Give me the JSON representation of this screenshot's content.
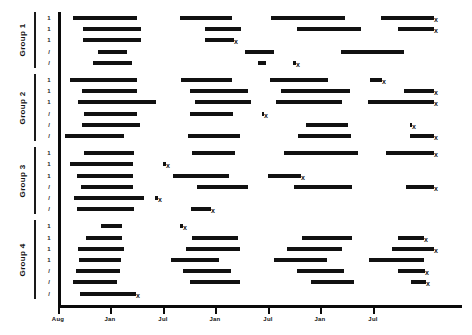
{
  "chart_data": {
    "type": "bar",
    "chart_style": "horizontal-interval-timeline",
    "title": "",
    "xlabel": "",
    "ylabel": "",
    "x_axis": {
      "tick_labels": [
        "Aug",
        "Jan",
        "Jul",
        "Jan",
        "Jul",
        "Jan",
        "Jul"
      ],
      "tick_pixels": [
        58,
        110,
        163,
        215,
        268,
        320,
        373
      ],
      "grid": false
    },
    "y_axis": {
      "group_labels": [
        "Group 1",
        "Group 2",
        "Group 3",
        "Group 4"
      ],
      "row_tick_labels": [
        "1",
        "1",
        "1",
        "/",
        "/",
        "1",
        "1",
        "1",
        "/",
        "/",
        "/",
        "1",
        "1",
        "1",
        "/",
        "/",
        "/",
        "1",
        "1",
        "1",
        "1",
        "/",
        "/",
        "/"
      ]
    },
    "legend": {
      "entries": [],
      "position": "none"
    },
    "annotations": {
      "censor_marker": "x"
    },
    "groups": [
      {
        "name": "Group 1",
        "rows": [
          {
            "tick": "1",
            "segments": [
              {
                "x0": 73,
                "x1": 137,
                "censored": false
              },
              {
                "x0": 180,
                "x1": 232,
                "censored": false
              },
              {
                "x0": 271,
                "x1": 345,
                "censored": false
              },
              {
                "x0": 381,
                "x1": 434,
                "censored": true
              }
            ]
          },
          {
            "tick": "1",
            "segments": [
              {
                "x0": 83,
                "x1": 141,
                "censored": false
              },
              {
                "x0": 205,
                "x1": 241,
                "censored": false
              },
              {
                "x0": 297,
                "x1": 361,
                "censored": false
              },
              {
                "x0": 398,
                "x1": 434,
                "censored": true
              }
            ]
          },
          {
            "tick": "1",
            "segments": [
              {
                "x0": 83,
                "x1": 141,
                "censored": false
              },
              {
                "x0": 205,
                "x1": 234,
                "censored": true
              }
            ]
          },
          {
            "tick": "/",
            "segments": [
              {
                "x0": 98,
                "x1": 127,
                "censored": false
              },
              {
                "x0": 245,
                "x1": 274,
                "censored": false
              },
              {
                "x0": 341,
                "x1": 404,
                "censored": false
              }
            ]
          },
          {
            "tick": "/",
            "segments": [
              {
                "x0": 93,
                "x1": 132,
                "censored": false
              },
              {
                "x0": 258,
                "x1": 266,
                "censored": false
              },
              {
                "x0": 293,
                "x1": 296,
                "censored": true
              }
            ]
          }
        ]
      },
      {
        "name": "Group 2",
        "rows": [
          {
            "tick": "1",
            "segments": [
              {
                "x0": 70,
                "x1": 137,
                "censored": false
              },
              {
                "x0": 181,
                "x1": 232,
                "censored": false
              },
              {
                "x0": 270,
                "x1": 328,
                "censored": false
              },
              {
                "x0": 370,
                "x1": 382,
                "censored": true
              }
            ]
          },
          {
            "tick": "1",
            "segments": [
              {
                "x0": 82,
                "x1": 137,
                "censored": false
              },
              {
                "x0": 190,
                "x1": 248,
                "censored": false
              },
              {
                "x0": 281,
                "x1": 350,
                "censored": false
              },
              {
                "x0": 404,
                "x1": 434,
                "censored": true
              }
            ]
          },
          {
            "tick": "1",
            "segments": [
              {
                "x0": 78,
                "x1": 156,
                "censored": false
              },
              {
                "x0": 195,
                "x1": 251,
                "censored": false
              },
              {
                "x0": 276,
                "x1": 342,
                "censored": false
              },
              {
                "x0": 368,
                "x1": 434,
                "censored": true
              }
            ]
          },
          {
            "tick": "/",
            "segments": [
              {
                "x0": 84,
                "x1": 137,
                "censored": false
              },
              {
                "x0": 190,
                "x1": 233,
                "censored": false
              },
              {
                "x0": 262,
                "x1": 264,
                "censored": true
              }
            ]
          },
          {
            "tick": "/",
            "segments": [
              {
                "x0": 82,
                "x1": 140,
                "censored": false
              },
              {
                "x0": 306,
                "x1": 348,
                "censored": false
              },
              {
                "x0": 410,
                "x1": 412,
                "censored": true
              }
            ]
          },
          {
            "tick": "/",
            "segments": [
              {
                "x0": 65,
                "x1": 124,
                "censored": false
              },
              {
                "x0": 188,
                "x1": 240,
                "censored": false
              },
              {
                "x0": 298,
                "x1": 351,
                "censored": false
              },
              {
                "x0": 410,
                "x1": 434,
                "censored": true
              }
            ]
          }
        ]
      },
      {
        "name": "Group 3",
        "rows": [
          {
            "tick": "1",
            "segments": [
              {
                "x0": 84,
                "x1": 134,
                "censored": false
              },
              {
                "x0": 192,
                "x1": 235,
                "censored": false
              },
              {
                "x0": 284,
                "x1": 358,
                "censored": false
              },
              {
                "x0": 386,
                "x1": 434,
                "censored": true
              }
            ]
          },
          {
            "tick": "1",
            "segments": [
              {
                "x0": 70,
                "x1": 133,
                "censored": false
              },
              {
                "x0": 163,
                "x1": 166,
                "censored": true
              }
            ]
          },
          {
            "tick": "1",
            "segments": [
              {
                "x0": 77,
                "x1": 133,
                "censored": false
              },
              {
                "x0": 173,
                "x1": 229,
                "censored": false
              },
              {
                "x0": 268,
                "x1": 301,
                "censored": true
              }
            ]
          },
          {
            "tick": "/",
            "segments": [
              {
                "x0": 81,
                "x1": 133,
                "censored": false
              },
              {
                "x0": 197,
                "x1": 248,
                "censored": false
              },
              {
                "x0": 294,
                "x1": 352,
                "censored": false
              },
              {
                "x0": 406,
                "x1": 434,
                "censored": true
              }
            ]
          },
          {
            "tick": "/",
            "segments": [
              {
                "x0": 74,
                "x1": 144,
                "censored": false
              },
              {
                "x0": 155,
                "x1": 158,
                "censored": true
              }
            ]
          },
          {
            "tick": "/",
            "segments": [
              {
                "x0": 77,
                "x1": 134,
                "censored": false
              },
              {
                "x0": 191,
                "x1": 211,
                "censored": true
              }
            ]
          }
        ]
      },
      {
        "name": "Group 4",
        "rows": [
          {
            "tick": "1",
            "segments": [
              {
                "x0": 101,
                "x1": 122,
                "censored": false
              },
              {
                "x0": 180,
                "x1": 183,
                "censored": true
              }
            ]
          },
          {
            "tick": "1",
            "segments": [
              {
                "x0": 86,
                "x1": 122,
                "censored": false
              },
              {
                "x0": 192,
                "x1": 238,
                "censored": false
              },
              {
                "x0": 302,
                "x1": 352,
                "censored": false
              },
              {
                "x0": 398,
                "x1": 424,
                "censored": true
              }
            ]
          },
          {
            "tick": "1",
            "segments": [
              {
                "x0": 78,
                "x1": 124,
                "censored": false
              },
              {
                "x0": 186,
                "x1": 240,
                "censored": false
              },
              {
                "x0": 287,
                "x1": 342,
                "censored": false
              },
              {
                "x0": 392,
                "x1": 434,
                "censored": true
              }
            ]
          },
          {
            "tick": "1",
            "segments": [
              {
                "x0": 79,
                "x1": 121,
                "censored": false
              },
              {
                "x0": 171,
                "x1": 219,
                "censored": false
              },
              {
                "x0": 274,
                "x1": 327,
                "censored": false
              },
              {
                "x0": 369,
                "x1": 424,
                "censored": false
              }
            ]
          },
          {
            "tick": "/",
            "segments": [
              {
                "x0": 76,
                "x1": 120,
                "censored": false
              },
              {
                "x0": 183,
                "x1": 231,
                "censored": false
              },
              {
                "x0": 297,
                "x1": 344,
                "censored": false
              },
              {
                "x0": 398,
                "x1": 425,
                "censored": true
              }
            ]
          },
          {
            "tick": "/",
            "segments": [
              {
                "x0": 73,
                "x1": 117,
                "censored": false
              },
              {
                "x0": 190,
                "x1": 240,
                "censored": false
              },
              {
                "x0": 311,
                "x1": 354,
                "censored": false
              },
              {
                "x0": 411,
                "x1": 426,
                "censored": true
              }
            ]
          },
          {
            "tick": "/",
            "segments": [
              {
                "x0": 80,
                "x1": 136,
                "censored": true
              }
            ]
          }
        ]
      }
    ]
  },
  "axis": {
    "y_spine_x": 58,
    "y_spine_top": 12,
    "y_spine_bottom": 305,
    "x_spine_y": 305,
    "x_spine_left": 58,
    "x_spine_right": 462
  }
}
